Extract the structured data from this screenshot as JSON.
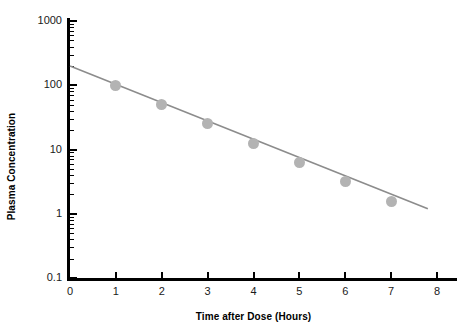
{
  "chart_data": {
    "type": "line",
    "title": "",
    "subtitle": "",
    "xlabel": "Time after Dose (Hours)",
    "ylabel": "Plasma Concentration",
    "x": [
      1,
      2,
      3,
      4,
      5,
      6,
      7
    ],
    "values": [
      100,
      50,
      25,
      12.5,
      6.25,
      3.125,
      1.5625
    ],
    "series": [
      {
        "name": "Plasma concentration vs time",
        "x": [
          1,
          2,
          3,
          4,
          5,
          6,
          7
        ],
        "values": [
          100,
          50,
          25,
          12.5,
          6.25,
          3.125,
          1.5625
        ]
      }
    ],
    "fit_line": {
      "name": "log-linear regression line",
      "x_start": 0,
      "y_start": 200,
      "x_end": 7.8,
      "y_end": 1.2
    },
    "xlim": [
      0,
      8
    ],
    "ylim": [
      0.1,
      1000
    ],
    "yscale": "log",
    "xscale": "linear",
    "grid": false,
    "legend": false,
    "legend_position": "none",
    "x_ticks": [
      "0",
      "1",
      "2",
      "3",
      "4",
      "5",
      "6",
      "7",
      "8"
    ],
    "x_tick_values": [
      0,
      1,
      2,
      3,
      4,
      5,
      6,
      7,
      8
    ],
    "y_ticks": [
      "0.1",
      "1",
      "10",
      "100",
      "1000"
    ],
    "y_tick_values": [
      0.1,
      1,
      10,
      100,
      1000
    ],
    "colors": {
      "marker": "#b3b3b3",
      "line": "#8c8c8c",
      "axis": "#000000",
      "text": "#1a1a1a",
      "background": "#ffffff"
    }
  }
}
